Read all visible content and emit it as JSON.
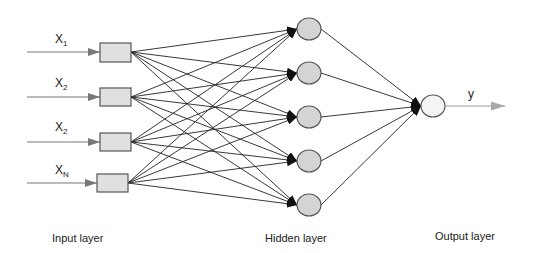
{
  "diagram": {
    "type": "feedforward-neural-network",
    "inputs": [
      {
        "label": "X",
        "sub": "1",
        "y": 52
      },
      {
        "label": "X",
        "sub": "2",
        "y": 97
      },
      {
        "label": "X",
        "sub": "2",
        "y": 142
      },
      {
        "label": "X",
        "sub": "N",
        "y": 183
      }
    ],
    "hidden_nodes": [
      29,
      73,
      117,
      161,
      205
    ],
    "output": {
      "label": "y"
    },
    "layer_labels": {
      "input": "Input layer",
      "hidden": "Hidden layer",
      "output": "Output layer"
    },
    "colors": {
      "node_fill": "#d4d4d4",
      "box_fill": "#e0e0e0",
      "stroke": "#555555",
      "edge": "#222222",
      "input_arrow": "#777777",
      "output_arrow": "#9a9a9a"
    }
  }
}
